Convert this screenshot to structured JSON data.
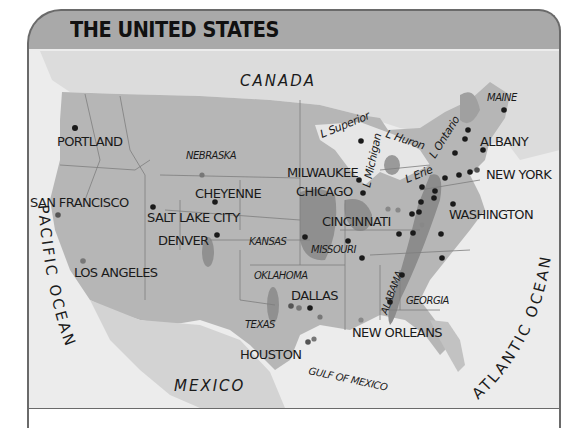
{
  "title": "THE UNITED STATES",
  "colors": {
    "header_bg": "#a9a9a9",
    "frame": "#6a6a6a",
    "water": "#ececec",
    "land_us": "#b3b3b3",
    "land_other": "#d6d6d6",
    "industrial_zone": "#8c8c8c",
    "city_dot": "#1a1a1a",
    "secondary_dot": "#7a7a7a"
  },
  "countries": [
    "CANADA",
    "MEXICO"
  ],
  "oceans": [
    "PACIFIC OCEAN",
    "ATLANTIC OCEAN",
    "GULF OF MEXICO"
  ],
  "lakes": [
    "L Superior",
    "L Michigan",
    "L Huron",
    "L Erie",
    "L Ontario"
  ],
  "states": [
    "NEBRASKA",
    "KANSAS",
    "MISSOURI",
    "OKLAHOMA",
    "TEXAS",
    "ALABAMA",
    "GEORGIA",
    "MAINE"
  ],
  "cities": [
    "PORTLAND",
    "SAN FRANCISCO",
    "SALT LAKE CITY",
    "CHEYENNE",
    "DENVER",
    "LOS ANGELES",
    "MILWAUKEE",
    "CHICAGO",
    "CINCINNATI",
    "DALLAS",
    "HOUSTON",
    "NEW ORLEANS",
    "WASHINGTON",
    "NEW YORK",
    "ALBANY"
  ]
}
